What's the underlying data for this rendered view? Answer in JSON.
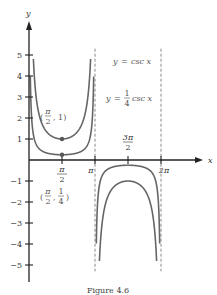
{
  "chart_data": {
    "type": "line",
    "title": "",
    "xlabel": "x",
    "ylabel": "y",
    "xlim": [
      0,
      6.6
    ],
    "ylim": [
      -5.8,
      5.8
    ],
    "x_ticks": [
      {
        "value": 1.5708,
        "label_num": "π",
        "label_den": "2"
      },
      {
        "value": 3.1416,
        "label": "π"
      },
      {
        "value": 4.7124,
        "label_num": "3π",
        "label_den": "2"
      },
      {
        "value": 6.2832,
        "label": "2π"
      }
    ],
    "y_ticks": [
      {
        "value": 5,
        "label": "5"
      },
      {
        "value": 4,
        "label": "4"
      },
      {
        "value": 3,
        "label": "3"
      },
      {
        "value": 2,
        "label": "2"
      },
      {
        "value": 1,
        "label": "1"
      },
      {
        "value": -1,
        "label": "−1"
      },
      {
        "value": -2,
        "label": "−2"
      },
      {
        "value": -3,
        "label": "−3"
      },
      {
        "value": -4,
        "label": "−4"
      },
      {
        "value": -5,
        "label": "−5"
      }
    ],
    "series": [
      {
        "name": "y = csc x",
        "coefficient": 1,
        "domain_clip": [
          -5,
          5
        ]
      },
      {
        "name": "y = 1/4 csc x",
        "coefficient": 0.25,
        "domain_clip": [
          -4,
          4
        ]
      }
    ],
    "asymptotes": [
      3.1416,
      6.2832
    ],
    "points": [
      {
        "x": 1.5708,
        "y": 1,
        "label": "(π/2, 1)"
      },
      {
        "x": 1.5708,
        "y": 0.25,
        "label": "(π/2, 1/4)"
      }
    ],
    "legend": [
      {
        "text_lhs": "y",
        "text_rhs": "csc x"
      },
      {
        "text_lhs": "y",
        "coef_num": "1",
        "coef_den": "4",
        "text_rhs": "csc x"
      }
    ],
    "grid": false
  },
  "caption": "Figure 4.6"
}
